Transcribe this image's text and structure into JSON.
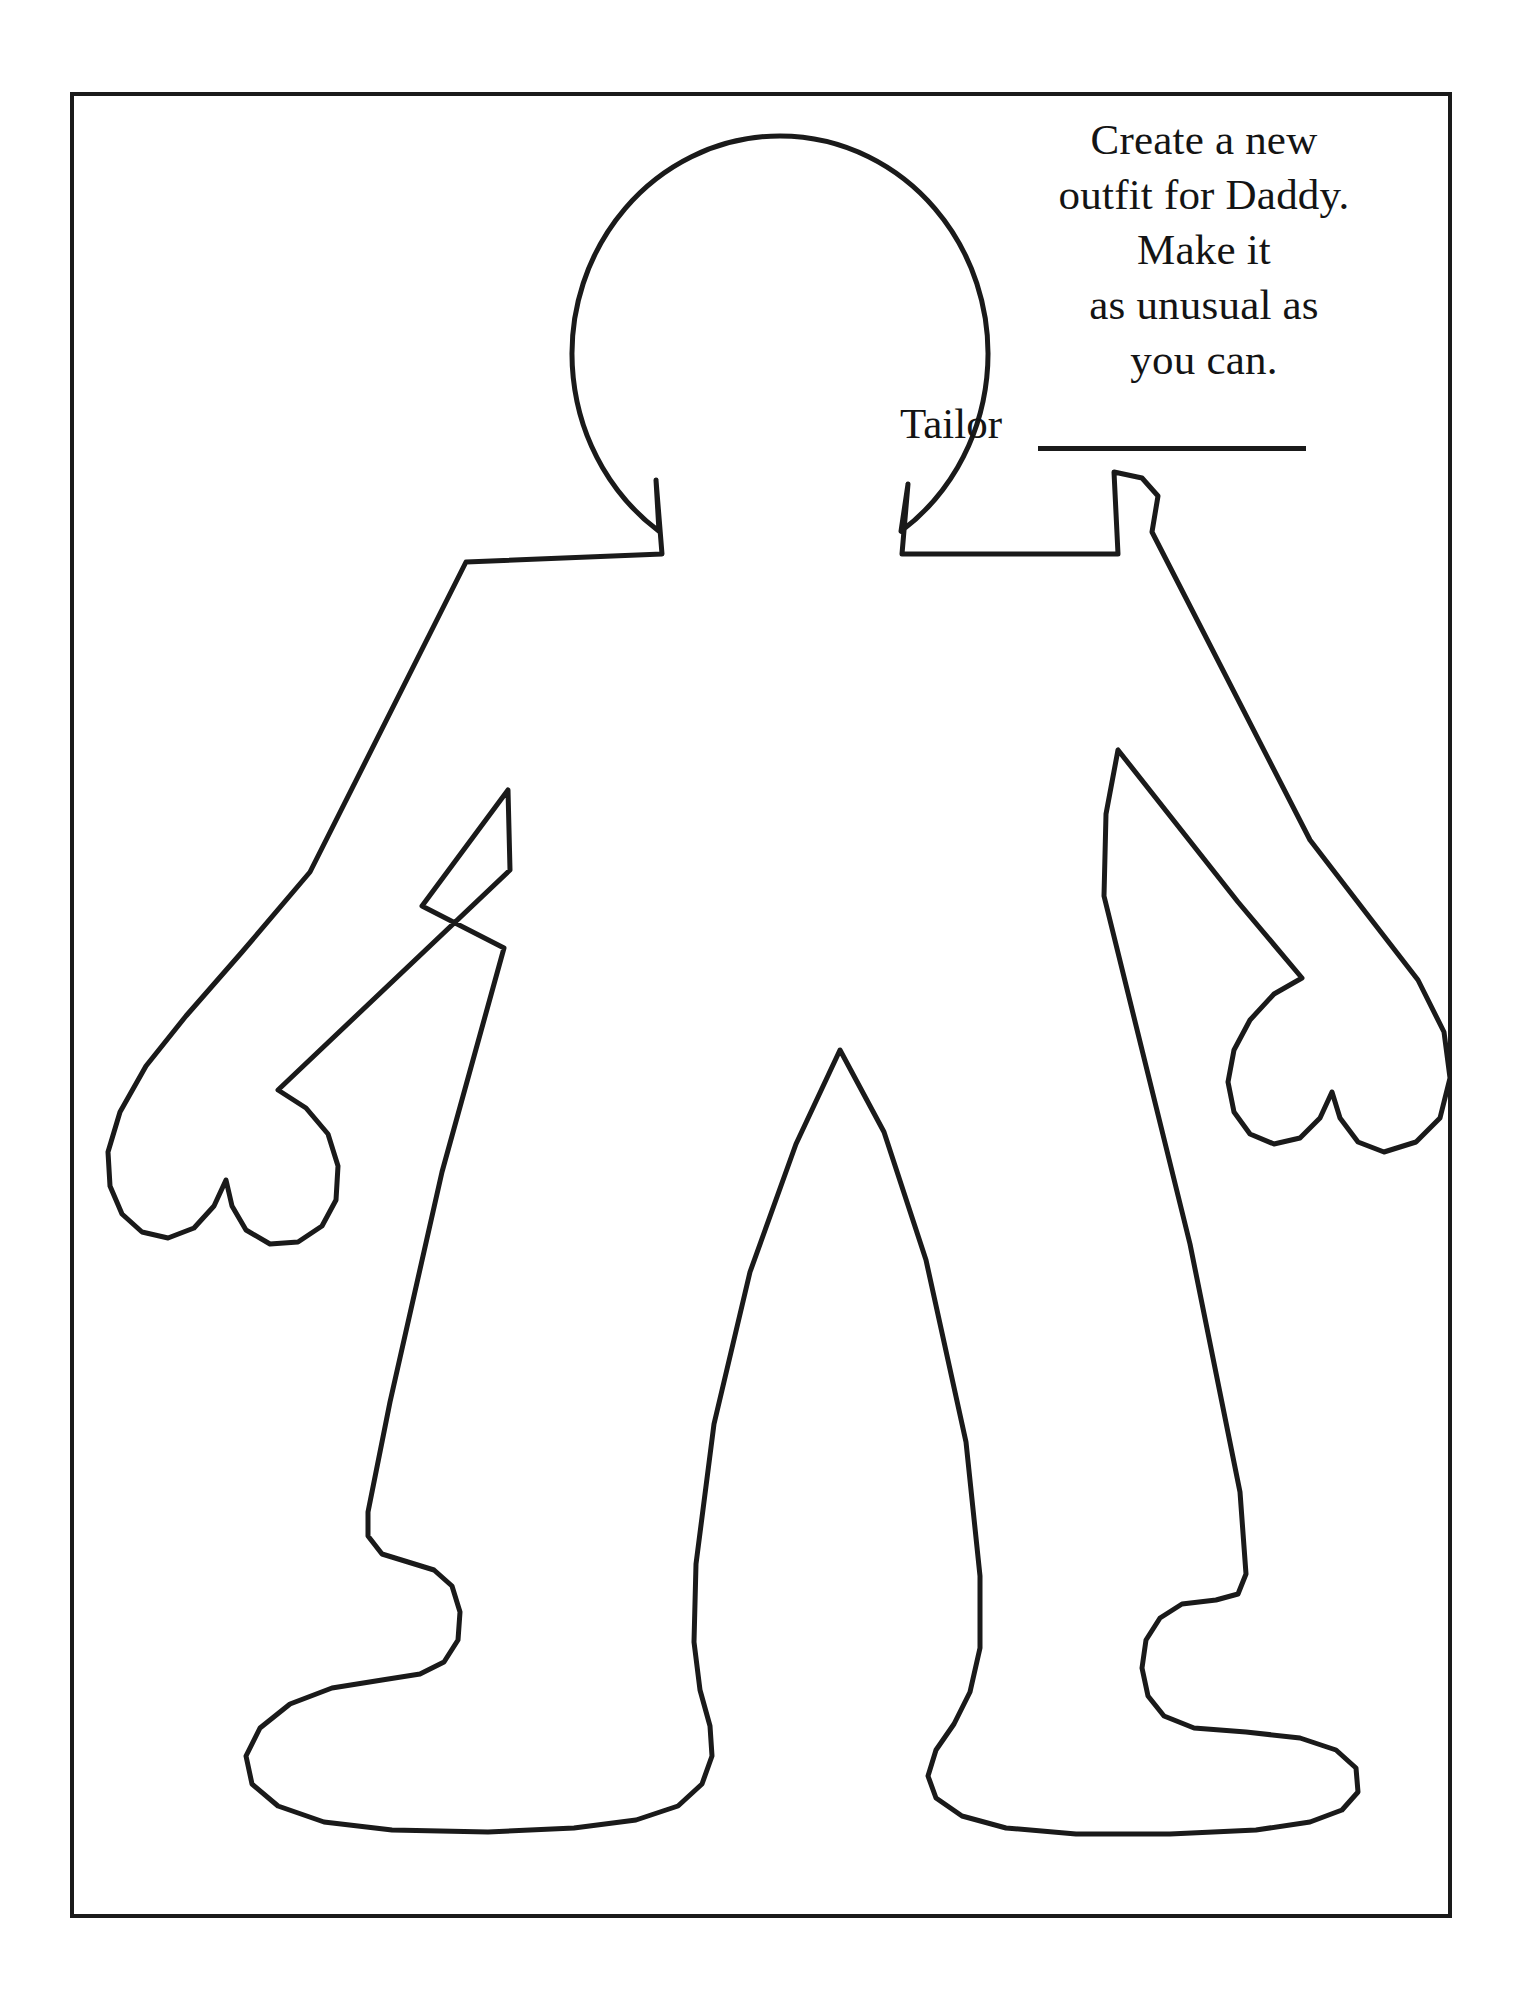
{
  "page": {
    "background_color": "#ffffff",
    "ink_color": "#1a1a1a",
    "border": {
      "name": "page-frame",
      "stroke_width_px": 4
    }
  },
  "instruction": {
    "lines": [
      "Create a new",
      "outfit for Daddy.",
      "Make it",
      "as unusual as",
      "you can."
    ],
    "full_text": "Create a new outfit for Daddy. Make it as unusual as you can.",
    "align": "center"
  },
  "tailor_field": {
    "label": "Tailor",
    "value": "",
    "placeholder": "",
    "has_blank_line": true
  },
  "figure": {
    "name": "paper-doll-outline",
    "fill": "#ffffff",
    "stroke": "#1a1a1a",
    "stroke_width_px": 5,
    "parts": [
      "head",
      "neck",
      "left-shoulder",
      "right-shoulder",
      "left-arm",
      "right-arm",
      "left-hand",
      "right-hand",
      "torso",
      "left-leg",
      "right-leg",
      "left-foot",
      "right-foot"
    ]
  }
}
